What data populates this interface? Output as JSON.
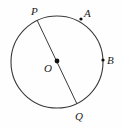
{
  "figure": {
    "type": "geometry-diagram",
    "background_color": "#fefefe",
    "stroke_color": "#3a3a3a",
    "label_color": "#1a1a1a",
    "circle": {
      "center_x": 57,
      "center_y": 62,
      "radius": 46,
      "stroke_width": 1.1
    },
    "center_point": {
      "label": "O",
      "x": 57,
      "y": 61,
      "marker": "filled-dot",
      "marker_radius": 2.4
    },
    "diameter": {
      "label": "PQ",
      "from_label": "P",
      "to_label": "Q",
      "x1": 37,
      "y1": 20,
      "x2": 77,
      "y2": 104,
      "stroke_width": 1.0
    },
    "points": [
      {
        "label": "P",
        "x": 37,
        "y": 20,
        "marker": "none",
        "on_circle": true,
        "label_offset_x": -6,
        "label_offset_y": -14
      },
      {
        "label": "A",
        "x": 81,
        "y": 19,
        "marker": "filled-dot",
        "marker_radius": 1.6,
        "on_circle": true,
        "label_offset_x": 3,
        "label_offset_y": -11
      },
      {
        "label": "B",
        "x": 103,
        "y": 60,
        "marker": "filled-dot",
        "marker_radius": 1.6,
        "on_circle": true,
        "label_offset_x": 4,
        "label_offset_y": -5
      },
      {
        "label": "Q",
        "x": 77,
        "y": 104,
        "marker": "none",
        "on_circle": true,
        "label_offset_x": -2,
        "label_offset_y": 7
      }
    ]
  }
}
